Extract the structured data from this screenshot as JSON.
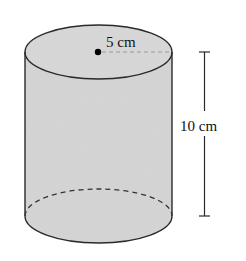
{
  "figure": {
    "shape": "cylinder",
    "radius_label": "5 cm",
    "height_label": "10 cm",
    "colors": {
      "fill": "#d6d6d6",
      "stroke": "#2a2a2a",
      "background": "#ffffff"
    }
  }
}
